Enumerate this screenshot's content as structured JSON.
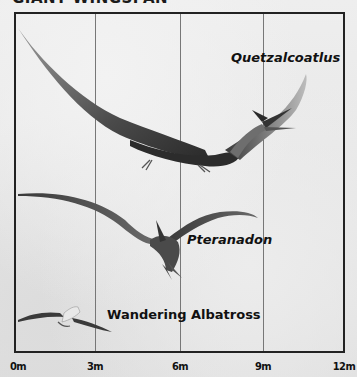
{
  "title": "GIANT WINGSPAN",
  "creatures": [
    {
      "name": "Quetzalcoatlus",
      "italic": true
    },
    {
      "name": "Pteranadon",
      "italic": true
    },
    {
      "name": "Wandering Albatross",
      "italic": false
    }
  ],
  "axis": {
    "ticks": [
      "0m",
      "3m",
      "6m",
      "9m",
      "12m"
    ],
    "unit": "m"
  },
  "colors": {
    "background": "#e9e9e9",
    "frame": "#222222",
    "gridline": "#777777",
    "text": "#111111"
  }
}
